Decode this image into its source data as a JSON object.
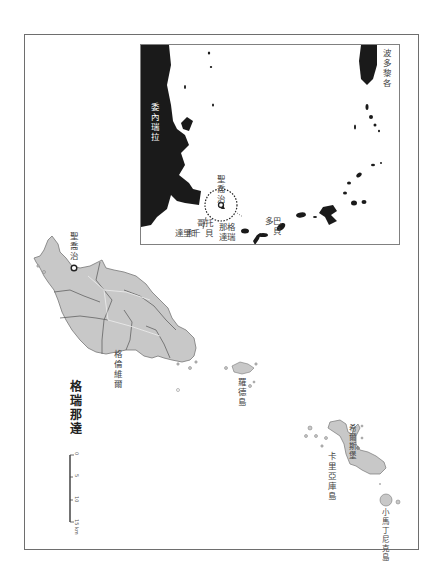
{
  "map": {
    "title": "格瑞那達",
    "orientation": "rotated 90° clockwise",
    "main_labels": {
      "capital": "聖喬治",
      "grenville": "格倫維爾",
      "ronde": "羅德島",
      "carriacou": "卡里亞庫島",
      "hillsborough": "希爾斯堡",
      "petite_martinique": "小馬丁尼克島"
    },
    "inset_labels": {
      "puerto_rico": "波多黎各",
      "venezuela": "委內瑞拉",
      "st_georges": "聖喬治",
      "grenada": "格瑞那達",
      "trinidad_tobago_1": "托貝哥",
      "trinidad_tobago_2": "和",
      "trinidad_tobago_3": "千里達",
      "barbados": "巴貝多"
    },
    "scale_bar": {
      "ticks": [
        "0",
        "5",
        "10",
        "15 km"
      ]
    },
    "colors": {
      "land_main": "#c8c8c8",
      "land_inset": "#1a1a1a",
      "border": "#6e6e6e",
      "parish_lines": "#555555",
      "background": "#ffffff"
    }
  }
}
